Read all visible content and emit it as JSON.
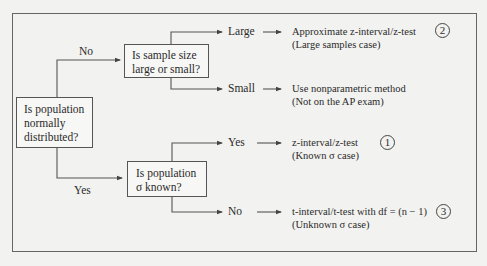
{
  "diagram": {
    "root": {
      "question": "Is population normally distributed?",
      "lines": [
        "Is population",
        "normally",
        "distributed?"
      ]
    },
    "branch_no": {
      "edge_label": "No",
      "question_lines": [
        "Is sample size",
        "large or small?"
      ],
      "outcomes": [
        {
          "edge_label": "Large",
          "result_line1": "Approximate z-interval/z-test",
          "result_line2": "(Large samples case)",
          "marker": "2"
        },
        {
          "edge_label": "Small",
          "result_line1": "Use nonparametric method",
          "result_line2": "(Not on the AP exam)",
          "marker": ""
        }
      ]
    },
    "branch_yes": {
      "edge_label": "Yes",
      "question_lines": [
        "Is population",
        "σ known?"
      ],
      "outcomes": [
        {
          "edge_label": "Yes",
          "result_line1": "z-interval/z-test",
          "result_line2": "(Known σ case)",
          "marker": "1"
        },
        {
          "edge_label": "No",
          "result_line1": "t-interval/t-test with df = (n − 1)",
          "result_line2": "(Unknown σ case)",
          "marker": "3"
        }
      ]
    },
    "colors": {
      "background": "#f2f2f0",
      "line": "#555555",
      "text": "#2a2a2a"
    }
  }
}
